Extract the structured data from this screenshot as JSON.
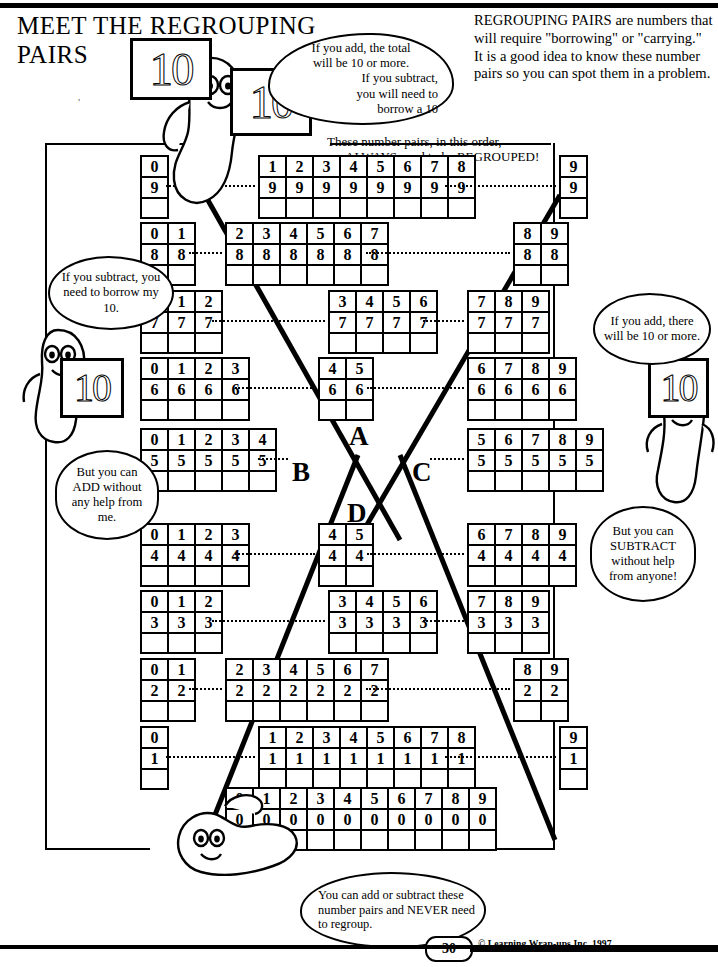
{
  "page": {
    "title_line1": "MEET THE REGROUPING",
    "title_line2": "PAIRS",
    "intro": "REGROUPING PAIRS are numbers that will require \"borrowing\" or \"carrying.\"  It is a good idea to know these number pairs so you can spot them in a problem.",
    "always_note_line1": "These number pairs, in this order,",
    "always_note_line2": "ALWAYS  need to be REGROUPED!",
    "page_number": "30",
    "copyright": "© Learning Wrap-ups Inc. 1997"
  },
  "bubbles": {
    "top": "If you add, the total will be 10 or more. If you subtract, you will need to borrow a 10",
    "top_lines": [
      "If you add, the total",
      "will be 10 or more.",
      "If you subtract,",
      "you will need to",
      "borrow a 10"
    ],
    "left_upper": "If you subtract, you need to borrow my 10.",
    "left_lower": "But you can ADD without any help from me.",
    "right_upper": "If you add, there will be 10 or more.",
    "right_lower": "But you can SUBTRACT without help from anyone!",
    "bottom": "You can add or subtract these number pairs and NEVER need to regroup."
  },
  "cards": {
    "ten": "10"
  },
  "center_letters": {
    "a": "A",
    "b": "B",
    "c": "C",
    "d": "D"
  },
  "chart_data": {
    "type": "table",
    "rows": [
      {
        "row_value": "9",
        "left_group": [
          "0"
        ],
        "center_group": [
          "1",
          "2",
          "3",
          "4",
          "5",
          "6",
          "7",
          "8"
        ],
        "right_group": [
          "9"
        ]
      },
      {
        "row_value": "8",
        "left_group": [
          "0",
          "1"
        ],
        "center_group": [
          "2",
          "3",
          "4",
          "5",
          "6",
          "7"
        ],
        "right_group": [
          "8",
          "9"
        ]
      },
      {
        "row_value": "7",
        "left_group": [
          "0",
          "1",
          "2"
        ],
        "center_group": [
          "3",
          "4",
          "5",
          "6"
        ],
        "right_group": [
          "7",
          "8",
          "9"
        ]
      },
      {
        "row_value": "6",
        "left_group": [
          "0",
          "1",
          "2",
          "3"
        ],
        "center_group": [
          "4",
          "5"
        ],
        "right_group": [
          "6",
          "7",
          "8",
          "9"
        ]
      },
      {
        "row_value": "5",
        "left_group": [
          "0",
          "1",
          "2",
          "3",
          "4"
        ],
        "center_group": [],
        "right_group": [
          "5",
          "6",
          "7",
          "8",
          "9"
        ]
      },
      {
        "row_value": "4",
        "left_group": [
          "0",
          "1",
          "2",
          "3"
        ],
        "center_group": [
          "4",
          "5"
        ],
        "right_group": [
          "6",
          "7",
          "8",
          "9"
        ]
      },
      {
        "row_value": "3",
        "left_group": [
          "0",
          "1",
          "2"
        ],
        "center_group": [
          "3",
          "4",
          "5",
          "6"
        ],
        "right_group": [
          "7",
          "8",
          "9"
        ]
      },
      {
        "row_value": "2",
        "left_group": [
          "0",
          "1"
        ],
        "center_group": [
          "2",
          "3",
          "4",
          "5",
          "6",
          "7"
        ],
        "right_group": [
          "8",
          "9"
        ]
      },
      {
        "row_value": "1",
        "left_group": [
          "0"
        ],
        "center_group": [
          "1",
          "2",
          "3",
          "4",
          "5",
          "6",
          "7",
          "8"
        ],
        "right_group": [
          "9"
        ]
      },
      {
        "row_value": "0",
        "left_group": [],
        "center_group": [
          "0",
          "1",
          "2",
          "3",
          "4",
          "5",
          "6",
          "7",
          "8",
          "9"
        ],
        "right_group": []
      }
    ]
  }
}
